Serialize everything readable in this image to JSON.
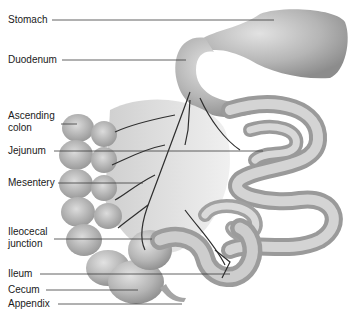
{
  "diagram": {
    "labels": [
      {
        "id": "stomach",
        "text": "Stomach",
        "x": 8,
        "y": 14,
        "line": {
          "x1": 52,
          "y1": 20,
          "x2": 274,
          "y2": 20
        }
      },
      {
        "id": "duodenum",
        "text": "Duodenum",
        "x": 8,
        "y": 54,
        "line": {
          "x1": 62,
          "y1": 60,
          "x2": 186,
          "y2": 60
        }
      },
      {
        "id": "ascending-colon",
        "text": "Ascending\ncolon",
        "x": 8,
        "y": 110,
        "line": {
          "x1": 61,
          "y1": 124,
          "x2": 77,
          "y2": 124
        }
      },
      {
        "id": "jejunum",
        "text": "Jejunum",
        "x": 8,
        "y": 145,
        "line": {
          "x1": 54,
          "y1": 151,
          "x2": 263,
          "y2": 151
        }
      },
      {
        "id": "mesentery",
        "text": "Mesentery",
        "x": 8,
        "y": 177,
        "line": {
          "x1": 58,
          "y1": 183,
          "x2": 143,
          "y2": 183
        }
      },
      {
        "id": "ileocecal-junction",
        "text": "Ileocecal\njunction",
        "x": 8,
        "y": 226,
        "line": {
          "x1": 54,
          "y1": 239,
          "x2": 152,
          "y2": 239
        }
      },
      {
        "id": "ileum",
        "text": "Ileum",
        "x": 8,
        "y": 268,
        "line": {
          "x1": 40,
          "y1": 274,
          "x2": 230,
          "y2": 274
        }
      },
      {
        "id": "cecum",
        "text": "Cecum",
        "x": 8,
        "y": 284,
        "line": {
          "x1": 46,
          "y1": 290,
          "x2": 138,
          "y2": 290
        }
      },
      {
        "id": "appendix",
        "text": "Appendix",
        "x": 8,
        "y": 298,
        "line": {
          "x1": 58,
          "y1": 304,
          "x2": 182,
          "y2": 304
        }
      }
    ]
  },
  "colors": {
    "organ_fill": "#b9b9b9",
    "organ_light": "#d8d8d8",
    "organ_dark": "#8a8a8a",
    "vessel": "#2e2e2e",
    "leader": "#3a3a3a",
    "text": "#1a1a1a"
  }
}
